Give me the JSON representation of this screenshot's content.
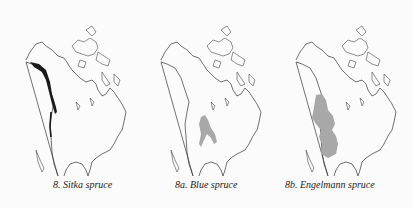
{
  "figure": {
    "maps": [
      {
        "id": "8",
        "caption": "8.  Sitka spruce",
        "range_style": "dark-coastal-strip",
        "range_color": "#1a1a1a"
      },
      {
        "id": "8a",
        "caption": "8a.  Blue spruce",
        "range_style": "gray-fill",
        "range_color": "#a8a8a8"
      },
      {
        "id": "8b",
        "caption": "8b.  Engelmann spruce",
        "range_style": "gray-fill",
        "range_color": "#a8a8a8"
      }
    ]
  }
}
